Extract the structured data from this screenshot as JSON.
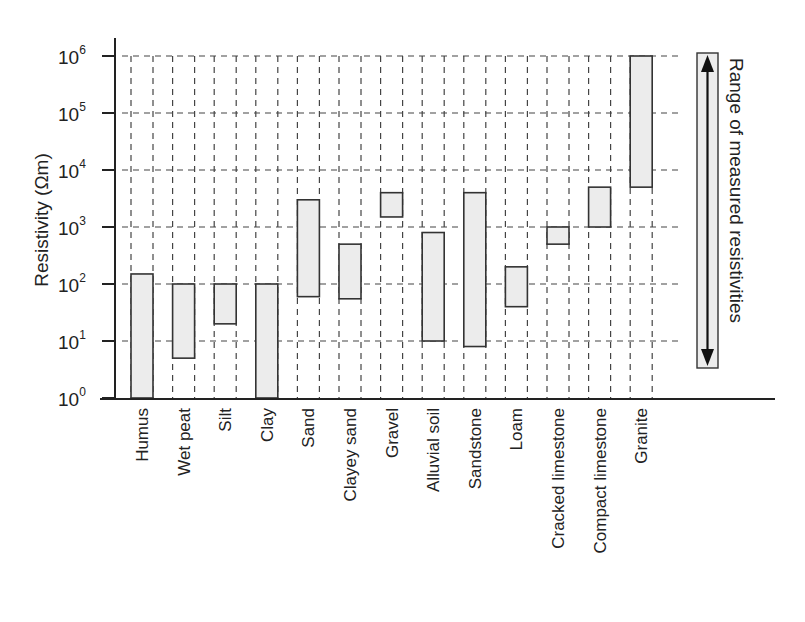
{
  "chart_data": {
    "type": "bar",
    "subtype": "floating-range-bar",
    "title": "",
    "xlabel": "",
    "ylabel": "Resistivity (Ωm)",
    "yscale": "log",
    "ylim": [
      1,
      1000000
    ],
    "yticks": [
      {
        "base": "10",
        "exp": "0",
        "value": 1
      },
      {
        "base": "10",
        "exp": "1",
        "value": 10
      },
      {
        "base": "10",
        "exp": "2",
        "value": 100
      },
      {
        "base": "10",
        "exp": "3",
        "value": 1000
      },
      {
        "base": "10",
        "exp": "4",
        "value": 10000
      },
      {
        "base": "10",
        "exp": "5",
        "value": 100000
      },
      {
        "base": "10",
        "exp": "6",
        "value": 1000000
      }
    ],
    "grid": true,
    "categories": [
      "Humus",
      "Wet peat",
      "Silt",
      "Clay",
      "Sand",
      "Clayey sand",
      "Gravel",
      "Alluvial soil",
      "Sandstone",
      "Loam",
      "Cracked limestone",
      "Compact limestone",
      "Granite"
    ],
    "series": [
      {
        "name": "min",
        "values": [
          1,
          5,
          20,
          1,
          60,
          55,
          1500,
          10,
          8,
          40,
          500,
          1000,
          5000
        ]
      },
      {
        "name": "max",
        "values": [
          150,
          100,
          100,
          100,
          3000,
          500,
          4000,
          800,
          4000,
          200,
          1000,
          5000,
          1000000
        ]
      }
    ],
    "legend": {
      "label": "Range of measured resistivities",
      "position": "right"
    }
  }
}
